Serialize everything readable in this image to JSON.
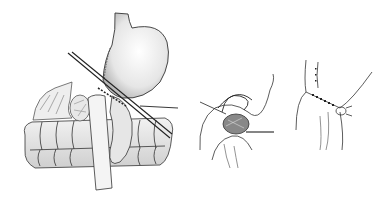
{
  "figure": {
    "background": "#ffffff",
    "stroke_color": "#2a2a2a",
    "shade_color": "#9a9a9a",
    "panels": [
      {
        "id": "panel-1",
        "subject": "stomach-with-stapler-and-intestine"
      },
      {
        "id": "panel-2",
        "subject": "suture-closure"
      },
      {
        "id": "panel-3",
        "subject": "completed-anastomosis"
      }
    ]
  }
}
